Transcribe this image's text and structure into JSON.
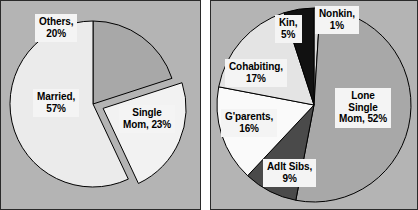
{
  "figure": {
    "background_color": "#ffffff",
    "panel_background_color": "#b4b4b4",
    "panel_border_color": "#2a2a2a",
    "label_background_color": "#f4f4f4",
    "label_text_color": "#000000"
  },
  "chart_data": [
    {
      "type": "pie",
      "id": "household-structure",
      "title": "",
      "categories": [
        "Others",
        "Single Mom",
        "Married"
      ],
      "values": [
        20,
        23,
        57
      ],
      "labels": [
        "Others, 20%",
        "Single Mom, 23%",
        "Married, 57%"
      ],
      "colors": [
        "#a8a8a8",
        "#f2f2f2",
        "#ebebeb"
      ],
      "exploded": [
        "Single Mom"
      ],
      "start_angle_deg": 0,
      "direction": "clockwise",
      "legend": "none",
      "grid": false,
      "slices": [
        {
          "name": "Others",
          "value": 20,
          "percent_text": "20%",
          "label_lines": [
            "Others,",
            "20%"
          ],
          "color": "#a8a8a8",
          "exploded": false
        },
        {
          "name": "Single Mom",
          "value": 23,
          "percent_text": "23%",
          "label_lines": [
            "Single",
            "Mom, 23%"
          ],
          "color": "#f2f2f2",
          "exploded": true
        },
        {
          "name": "Married",
          "value": 57,
          "percent_text": "57%",
          "label_lines": [
            "Married,",
            "57%"
          ],
          "color": "#ebebeb",
          "exploded": false
        }
      ]
    },
    {
      "type": "pie",
      "id": "single-mom-household-composition",
      "title": "",
      "categories": [
        "Nonkin",
        "Lone Single Mom",
        "Adlt Sibs",
        "G'parents",
        "Cohabiting",
        "Kin"
      ],
      "values": [
        1,
        52,
        9,
        16,
        17,
        5
      ],
      "labels": [
        "Nonkin, 1%",
        "Lone Single Mom, 52%",
        "Adlt Sibs, 9%",
        "G'parents, 16%",
        "Cohabiting, 17%",
        "Kin, 5%"
      ],
      "colors": [
        "#d8d8d8",
        "#a8a8a8",
        "#4a4a4a",
        "#fafafa",
        "#e4e4e4",
        "#111111"
      ],
      "exploded": [],
      "start_angle_deg": 0,
      "direction": "clockwise",
      "legend": "none",
      "grid": false,
      "slices": [
        {
          "name": "Nonkin",
          "value": 1,
          "percent_text": "1%",
          "label_lines": [
            "Nonkin,",
            "1%"
          ],
          "color": "#d8d8d8",
          "exploded": false
        },
        {
          "name": "Lone Single Mom",
          "value": 52,
          "percent_text": "52%",
          "label_lines": [
            "Lone",
            "Single",
            "Mom, 52%"
          ],
          "color": "#a8a8a8",
          "exploded": false
        },
        {
          "name": "Adlt Sibs",
          "value": 9,
          "percent_text": "9%",
          "label_lines": [
            "Adlt Sibs,",
            "9%"
          ],
          "color": "#4a4a4a",
          "exploded": false
        },
        {
          "name": "G'parents",
          "value": 16,
          "percent_text": "16%",
          "label_lines": [
            "G'parents,",
            "16%"
          ],
          "color": "#fafafa",
          "exploded": false
        },
        {
          "name": "Cohabiting",
          "value": 17,
          "percent_text": "17%",
          "label_lines": [
            "Cohabiting,",
            "17%"
          ],
          "color": "#e4e4e4",
          "exploded": false
        },
        {
          "name": "Kin",
          "value": 5,
          "percent_text": "5%",
          "label_lines": [
            "Kin,",
            "5%"
          ],
          "color": "#111111",
          "exploded": false
        }
      ]
    }
  ]
}
